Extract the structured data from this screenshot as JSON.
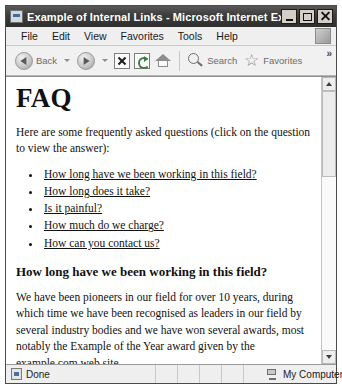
{
  "window": {
    "title": "Example of Internal Links - Microsoft Internet Explorer",
    "title_icon": "page-icon",
    "buttons": {
      "minimize": "minimize-icon",
      "maximize": "maximize-icon",
      "close": "close-icon"
    }
  },
  "menubar": {
    "items": [
      {
        "label": "File"
      },
      {
        "label": "Edit"
      },
      {
        "label": "View"
      },
      {
        "label": "Favorites"
      },
      {
        "label": "Tools"
      },
      {
        "label": "Help"
      }
    ]
  },
  "toolbar": {
    "back_label": "Back",
    "search_label": "Search",
    "favorites_label": "Favorites",
    "overflow_label": "»",
    "icons": {
      "back": "back-arrow-icon",
      "forward": "forward-arrow-icon",
      "stop": "stop-icon",
      "refresh": "refresh-icon",
      "home": "home-icon",
      "search": "magnifier-icon",
      "favorites": "star-icon"
    }
  },
  "page": {
    "heading": "FAQ",
    "intro": "Here are some frequently asked questions (click on the question to view the answer):",
    "questions": [
      {
        "label": "How long have we been working in this field?"
      },
      {
        "label": "How long does it take?"
      },
      {
        "label": "Is it painful?"
      },
      {
        "label": "How much do we charge?"
      },
      {
        "label": "How can you contact us?"
      }
    ],
    "answer_heading": "How long have we been working in this field?",
    "answer_body": "We have been pioneers in our field for over 10 years, during which time we have been recognised as leaders in our field by several industry bodies and we have won several awards, most notably the Example of the Year award given by the example.com web site."
  },
  "statusbar": {
    "status_text": "Done",
    "zone_text": "My Computer"
  }
}
